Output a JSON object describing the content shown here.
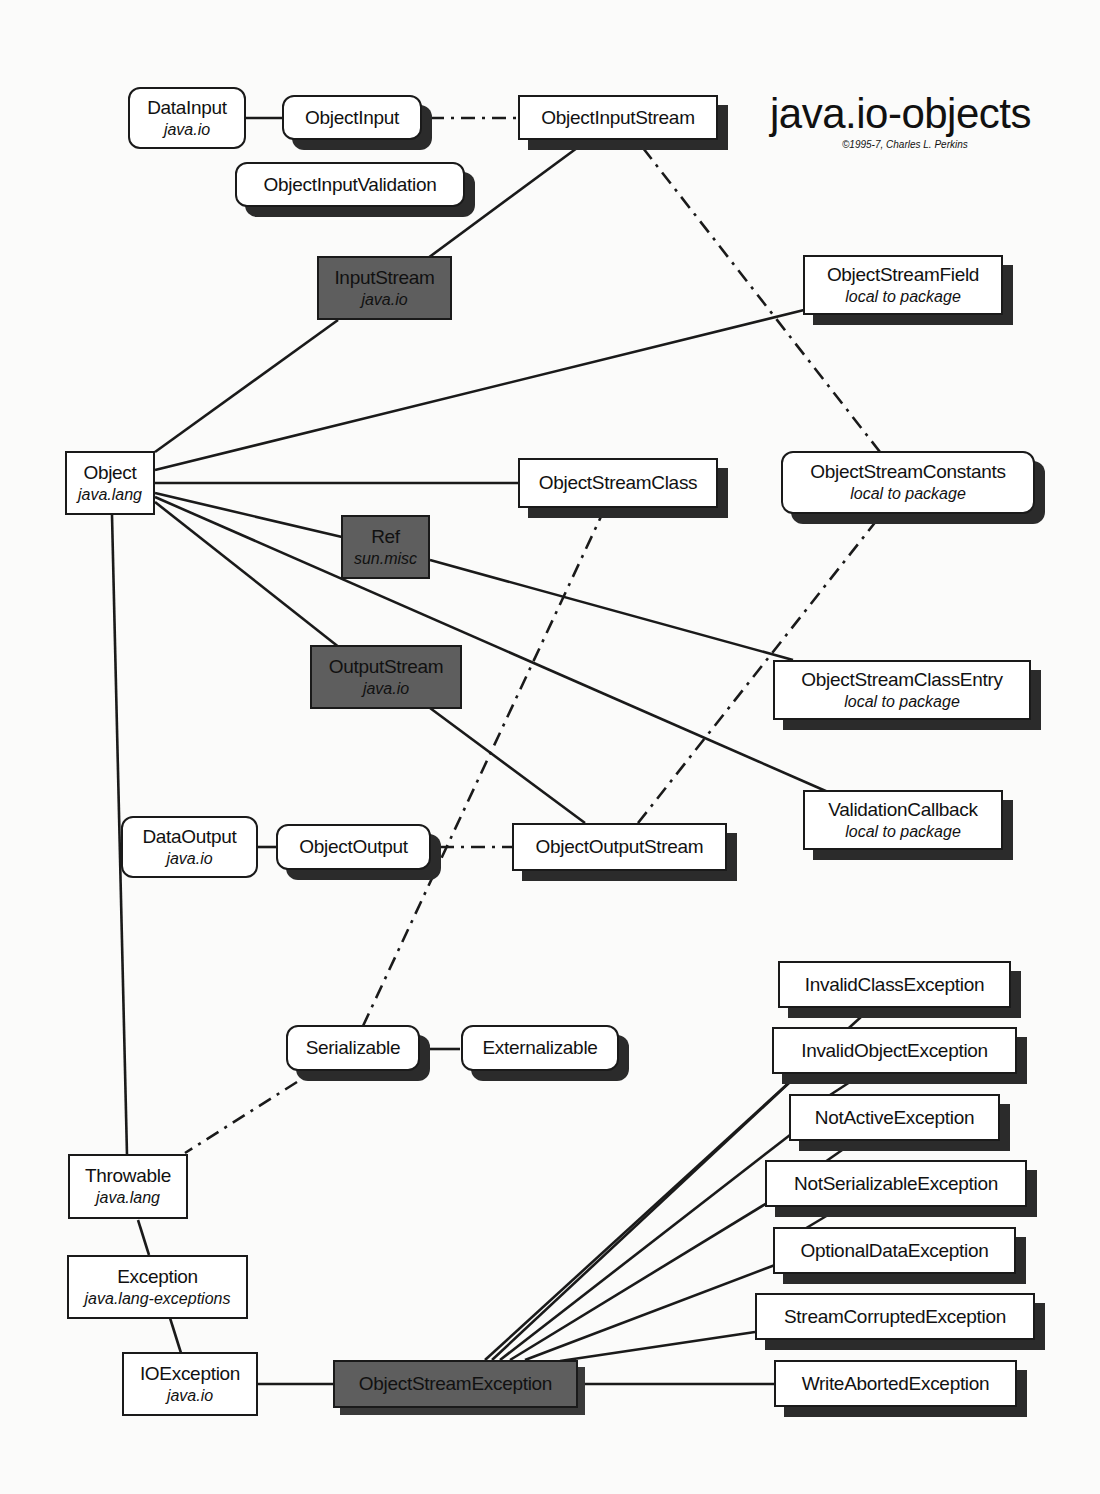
{
  "header": {
    "title": "java.io-objects",
    "copyright": "©1995-7, Charles L. Perkins"
  },
  "colors": {
    "line": "#1a1a1a",
    "dark_node_fill": "#5e5e5e",
    "light_node_fill": "#ffffff",
    "shadow": "#2b2b2b"
  },
  "nodes": {
    "datainput": {
      "name": "DataInput",
      "pkg": "java.io"
    },
    "objectinput": {
      "name": "ObjectInput"
    },
    "ois": {
      "name": "ObjectInputStream"
    },
    "oiv": {
      "name": "ObjectInputValidation"
    },
    "inputstream": {
      "name": "InputStream",
      "pkg": "java.io"
    },
    "osfield": {
      "name": "ObjectStreamField",
      "pkg": "local to package"
    },
    "object": {
      "name": "Object",
      "pkg": "java.lang"
    },
    "osclass": {
      "name": "ObjectStreamClass"
    },
    "osconstants": {
      "name": "ObjectStreamConstants",
      "pkg": "local to package"
    },
    "ref": {
      "name": "Ref",
      "pkg": "sun.misc"
    },
    "outputstream": {
      "name": "OutputStream",
      "pkg": "java.io"
    },
    "osclassentry": {
      "name": "ObjectStreamClassEntry",
      "pkg": "local to package"
    },
    "validationcb": {
      "name": "ValidationCallback",
      "pkg": "local to package"
    },
    "dataoutput": {
      "name": "DataOutput",
      "pkg": "java.io"
    },
    "objectoutput": {
      "name": "ObjectOutput"
    },
    "oos": {
      "name": "ObjectOutputStream"
    },
    "serializable": {
      "name": "Serializable"
    },
    "externalizable": {
      "name": "Externalizable"
    },
    "throwable": {
      "name": "Throwable",
      "pkg": "java.lang"
    },
    "exception": {
      "name": "Exception",
      "pkg": "java.lang-exceptions"
    },
    "ioexception": {
      "name": "IOException",
      "pkg": "java.io"
    },
    "osexception": {
      "name": "ObjectStreamException"
    },
    "invalidclass": {
      "name": "InvalidClassException"
    },
    "invalidobject": {
      "name": "InvalidObjectException"
    },
    "notactive": {
      "name": "NotActiveException"
    },
    "notserializable": {
      "name": "NotSerializableException"
    },
    "optionaldata": {
      "name": "OptionalDataException"
    },
    "streamcorrupted": {
      "name": "StreamCorruptedException"
    },
    "writeaborted": {
      "name": "WriteAbortedException"
    }
  },
  "edges": {
    "solid": [
      [
        "datainput",
        "objectinput"
      ],
      [
        "ois",
        "inputstream"
      ],
      [
        "inputstream",
        "object"
      ],
      [
        "object",
        "osfield"
      ],
      [
        "object",
        "osclass"
      ],
      [
        "object",
        "ref"
      ],
      [
        "object",
        "outputstream"
      ],
      [
        "object",
        "validationcb"
      ],
      [
        "ref",
        "osclassentry"
      ],
      [
        "outputstream",
        "oos"
      ],
      [
        "dataoutput",
        "objectoutput"
      ],
      [
        "serializable",
        "externalizable"
      ],
      [
        "object",
        "throwable"
      ],
      [
        "throwable",
        "exception"
      ],
      [
        "exception",
        "ioexception"
      ],
      [
        "ioexception",
        "osexception"
      ],
      [
        "osexception",
        "invalidclass"
      ],
      [
        "osexception",
        "invalidobject"
      ],
      [
        "osexception",
        "notactive"
      ],
      [
        "osexception",
        "notserializable"
      ],
      [
        "osexception",
        "optionaldata"
      ],
      [
        "osexception",
        "streamcorrupted"
      ],
      [
        "osexception",
        "writeaborted"
      ]
    ],
    "implements_dashdot": [
      [
        "objectinput",
        "ois"
      ],
      [
        "ois",
        "osconstants"
      ],
      [
        "osclass",
        "serializable"
      ],
      [
        "osconstants",
        "oos"
      ],
      [
        "objectoutput",
        "oos"
      ],
      [
        "serializable",
        "throwable"
      ]
    ]
  }
}
